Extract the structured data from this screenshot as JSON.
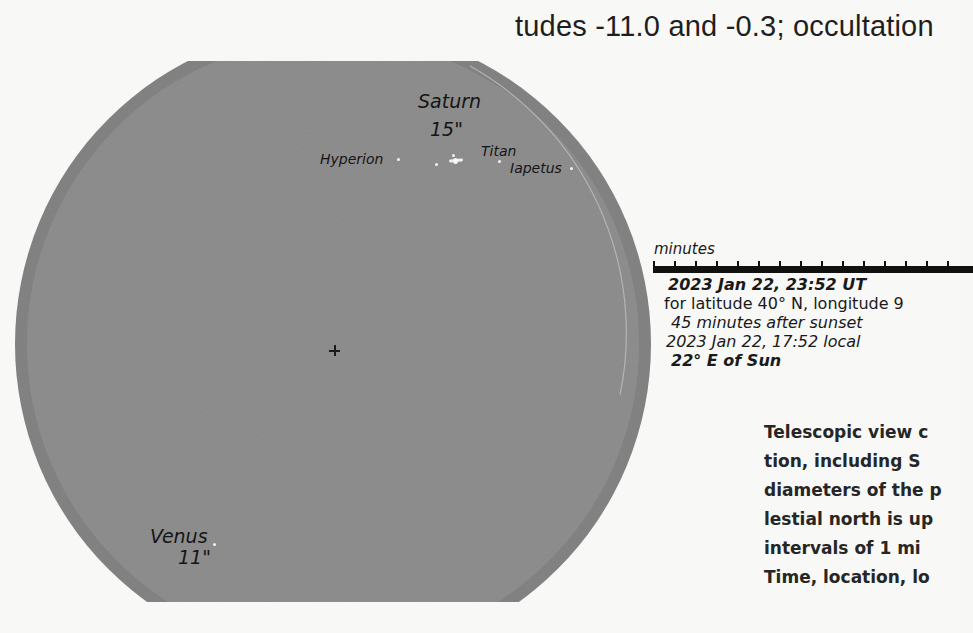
{
  "page": {
    "top_caption_fragment": "tudes -11.0 and -0.3; occultation",
    "colors": {
      "paper": "#f8f8f6",
      "field_gray": "#8e8e8e",
      "field_rim": "#7f7f7f",
      "text": "#1a1a1a",
      "moon_dots": "#f4f4f4"
    }
  },
  "telescope_view": {
    "objects": [
      {
        "name": "Saturn",
        "diameter": "15\""
      },
      {
        "name": "Venus",
        "diameter": "11\""
      }
    ],
    "moons": [
      {
        "name": "Hyperion"
      },
      {
        "name": "Titan"
      },
      {
        "name": "Iapetus"
      }
    ],
    "center_marker": "+"
  },
  "scale": {
    "label": "minutes",
    "tick_count": 15
  },
  "info": {
    "datetime_ut": "2023 Jan 22, 23:52 UT",
    "location": "for latitude 40° N, longitude 9",
    "after_sunset": "45 minutes after sunset",
    "datetime_local": "2023 Jan 22, 17:52 local",
    "elongation": "22° E of Sun"
  },
  "caption": {
    "lines": [
      "Telescopic view c",
      "tion, including S",
      "diameters of the p",
      "lestial north is up",
      "intervals of 1 mi",
      "Time, location, lo"
    ]
  }
}
